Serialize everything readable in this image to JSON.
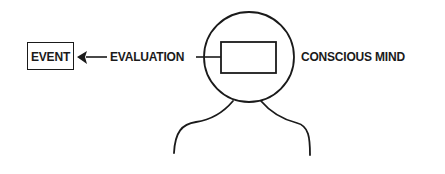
{
  "diagram": {
    "nodes": {
      "event": {
        "label": "EVENT"
      },
      "evaluation": {
        "label": "EVALUATION"
      },
      "conscious_mind": {
        "label": "CONSCIOUS MIND"
      }
    },
    "edges": [
      {
        "from": "conscious_mind_box",
        "to": "event",
        "via": "evaluation",
        "arrow": "to-event"
      }
    ],
    "figure": {
      "head": "circle",
      "inner_box": "rectangle inside head",
      "shoulders": "curved lines"
    },
    "colors": {
      "stroke": "#1a1a1a",
      "background": "#ffffff"
    }
  }
}
